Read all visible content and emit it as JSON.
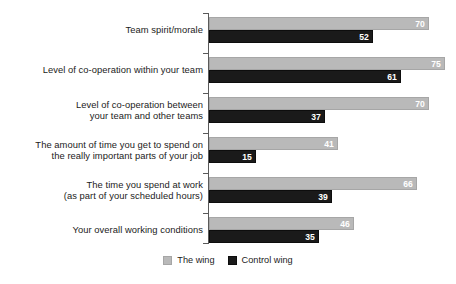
{
  "chart_data": {
    "type": "bar",
    "orientation": "horizontal",
    "title": "",
    "subtitle": "",
    "xlabel": "",
    "ylabel": "",
    "grid": false,
    "legend_position": "bottom-center",
    "xlim": [
      0,
      76
    ],
    "categories": [
      "Team spirit/morale",
      "Level of co-operation within your team",
      "Level of co-operation between\nyour team and other teams",
      "The amount of time you get to spend on\nthe really important parts of your job",
      "The time you spend at work\n(as part of your scheduled hours)",
      "Your overall working conditions"
    ],
    "series": [
      {
        "name": "The wing",
        "color": "#b9b9b9",
        "values": [
          70,
          75,
          70,
          41,
          66,
          46
        ]
      },
      {
        "name": "Control wing",
        "color": "#1a1a1a",
        "values": [
          52,
          61,
          37,
          15,
          39,
          35
        ]
      }
    ]
  },
  "legend": {
    "items": [
      {
        "label": "The wing",
        "swatch": "light"
      },
      {
        "label": "Control wing",
        "swatch": "dark"
      }
    ]
  }
}
